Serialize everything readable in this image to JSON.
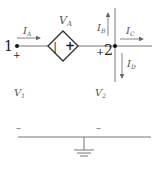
{
  "diagram": {
    "type": "circuit",
    "colors": {
      "wire": "#777777",
      "dark": "#222222",
      "label": "#555555"
    },
    "nodes": {
      "node1": {
        "label": "1",
        "plus": "+",
        "voltage": "V",
        "voltage_sub": "1",
        "minus": "–"
      },
      "node2": {
        "label": "2",
        "plus": "+",
        "voltage": "V",
        "voltage_sub": "2",
        "minus": "–"
      }
    },
    "source": {
      "kind": "dependent-voltage-source",
      "label": "V",
      "label_sub": "A",
      "minus_sign": "|",
      "plus_sign": "+"
    },
    "currents": [
      {
        "id": "IA",
        "label": "I",
        "sub": "A",
        "direction": "right"
      },
      {
        "id": "IB",
        "label": "I",
        "sub": "B",
        "direction": "up"
      },
      {
        "id": "IC",
        "label": "I",
        "sub": "C",
        "direction": "right"
      },
      {
        "id": "ID",
        "label": "I",
        "sub": "D",
        "direction": "down"
      }
    ],
    "ground": {
      "label": "ground"
    }
  }
}
